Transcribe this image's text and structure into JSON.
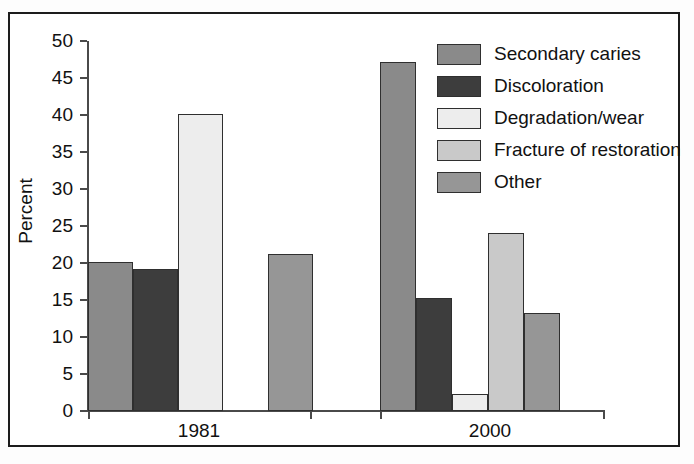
{
  "chart_data": {
    "type": "bar",
    "title": "",
    "xlabel": "",
    "ylabel": "Percent",
    "categories": [
      "1981",
      "2000"
    ],
    "ylim": [
      0,
      50
    ],
    "ytick_step": 5,
    "ytick_labels": [
      "50",
      "45",
      "40",
      "35",
      "30",
      "25",
      "20",
      "15",
      "10",
      "5",
      "0"
    ],
    "grid": false,
    "legend_position": "top-right",
    "series": [
      {
        "name": "Secondary caries",
        "color": "#8a8a8a",
        "values": [
          20.1,
          47.1
        ]
      },
      {
        "name": "Discoloration",
        "color": "#3d3d3d",
        "values": [
          19.2,
          15.3
        ]
      },
      {
        "name": "Degradation/wear",
        "color": "#ededed",
        "values": [
          40.1,
          2.3
        ]
      },
      {
        "name": "Fracture of restoration",
        "color": "#c9c9c9",
        "values": [
          0.0,
          24.1
        ]
      },
      {
        "name": "Other",
        "color": "#969696",
        "values": [
          21.2,
          13.2
        ]
      }
    ]
  },
  "axis": {
    "y_title": "Percent",
    "ticks": [
      {
        "label": "50",
        "value": 50
      },
      {
        "label": "45",
        "value": 45
      },
      {
        "label": "40",
        "value": 40
      },
      {
        "label": "35",
        "value": 35
      },
      {
        "label": "30",
        "value": 30
      },
      {
        "label": "25",
        "value": 25
      },
      {
        "label": "20",
        "value": 20
      },
      {
        "label": "15",
        "value": 15
      },
      {
        "label": "10",
        "value": 10
      },
      {
        "label": "5",
        "value": 5
      },
      {
        "label": "0",
        "value": 0
      }
    ],
    "categories": [
      "1981",
      "2000"
    ]
  },
  "legend": {
    "items": [
      {
        "label": "Secondary caries",
        "color": "#8a8a8a"
      },
      {
        "label": "Discoloration",
        "color": "#3d3d3d"
      },
      {
        "label": "Degradation/wear",
        "color": "#ededed"
      },
      {
        "label": "Fracture of restoration",
        "color": "#c9c9c9"
      },
      {
        "label": "Other",
        "color": "#969696"
      }
    ]
  }
}
